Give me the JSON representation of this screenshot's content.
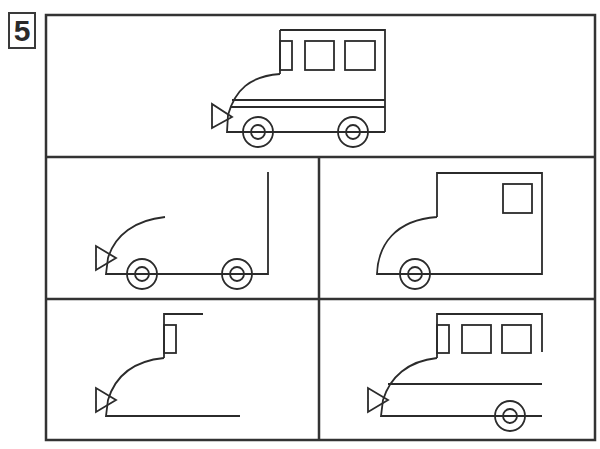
{
  "puzzle": {
    "number": "5",
    "description": "Drawing sequence: complete bus at top, four step panels below",
    "colors": {
      "line": "#2b2b2b",
      "frame": "#333333",
      "background": "#ffffff"
    }
  },
  "panels": [
    {
      "id": "reference",
      "label": "Completed bus"
    },
    {
      "id": "step-1",
      "label": "Base line, front curve, headlight, two wheels, rear line"
    },
    {
      "id": "step-2",
      "label": "Body outline with one window and front wheel"
    },
    {
      "id": "step-3",
      "label": "Front curve, headlight, driver window, roof start, base line"
    },
    {
      "id": "step-4",
      "label": "Roof, three windows, stripe line, base line, rear wheel"
    }
  ]
}
